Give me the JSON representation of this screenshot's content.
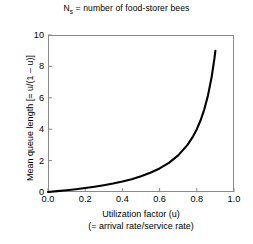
{
  "caption": {
    "prefix": "N",
    "subscript": "s",
    "rest": " = number of food-storer bees"
  },
  "chart_data": {
    "type": "line",
    "title": "",
    "subtitle": "",
    "xlabel": "Utilization factor (u)",
    "xlabel_line2": "(= arrival rate/service rate)",
    "ylabel": "Mean queue length [= u/(1 – u)]",
    "xlim": [
      0.0,
      1.0
    ],
    "ylim": [
      0,
      10
    ],
    "xticks": [
      "0.0",
      "0.2",
      "0.4",
      "0.6",
      "0.8",
      "1.0"
    ],
    "xtick_values": [
      0.0,
      0.2,
      0.4,
      0.6,
      0.8,
      1.0
    ],
    "yticks": [
      "0",
      "2",
      "4",
      "6",
      "8",
      "10"
    ],
    "ytick_values": [
      0,
      2,
      4,
      6,
      8,
      10
    ],
    "grid": false,
    "legend": "none",
    "series": [
      {
        "name": "u/(1 - u)",
        "color": "#000000",
        "line_width": 2.1,
        "x": [
          0.0,
          0.05,
          0.1,
          0.15,
          0.2,
          0.25,
          0.3,
          0.35,
          0.4,
          0.45,
          0.5,
          0.55,
          0.6,
          0.65,
          0.7,
          0.75,
          0.78,
          0.8,
          0.82,
          0.84,
          0.86,
          0.88,
          0.895,
          0.9
        ],
        "y": [
          0.0,
          0.053,
          0.111,
          0.176,
          0.25,
          0.333,
          0.429,
          0.538,
          0.667,
          0.818,
          1.0,
          1.222,
          1.5,
          1.857,
          2.333,
          3.0,
          3.545,
          4.0,
          4.556,
          5.25,
          6.143,
          7.333,
          8.524,
          9.0
        ]
      }
    ],
    "axis_color": "#8a8a8a",
    "background": "#ffffff"
  }
}
